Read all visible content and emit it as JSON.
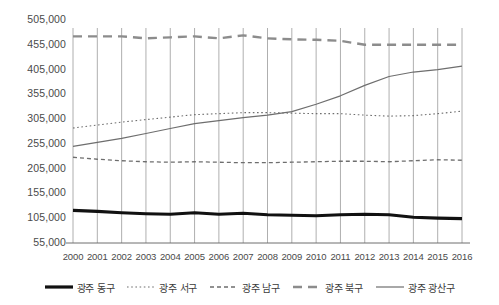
{
  "chart_data": {
    "type": "line",
    "title": "",
    "xlabel": "",
    "ylabel": "",
    "x": [
      2000,
      2001,
      2002,
      2003,
      2004,
      2005,
      2006,
      2007,
      2008,
      2009,
      2010,
      2011,
      2012,
      2013,
      2014,
      2015,
      2016
    ],
    "categories": [
      "2000",
      "2001",
      "2002",
      "2003",
      "2004",
      "2005",
      "2006",
      "2007",
      "2008",
      "2009",
      "2010",
      "2011",
      "2012",
      "2013",
      "2014",
      "2015",
      "2016"
    ],
    "ylim": [
      55000,
      505000
    ],
    "ytick_labels": [
      "505,000",
      "455,000",
      "405,000",
      "355,000",
      "305,000",
      "255,000",
      "205,000",
      "155,000",
      "105,000",
      "55,000"
    ],
    "yticks": [
      505000,
      455000,
      405000,
      355000,
      305000,
      255000,
      205000,
      155000,
      105000,
      55000
    ],
    "ystep": 50000,
    "grid": "vertical-only",
    "legend_position": "bottom",
    "series": [
      {
        "name": "광주 동구",
        "style": "thick-solid",
        "color": "#111111",
        "width": 3.2,
        "dash": "",
        "values": [
          121000,
          119000,
          116000,
          114000,
          113000,
          116000,
          113000,
          115000,
          112000,
          111000,
          110000,
          112000,
          113000,
          112000,
          107000,
          105000,
          104000
        ]
      },
      {
        "name": "광주 서구",
        "style": "dotted",
        "color": "#6e6e6e",
        "width": 1.1,
        "dash": "1.6 2.6",
        "values": [
          287000,
          293000,
          299000,
          304000,
          309000,
          314000,
          316000,
          318000,
          318000,
          317000,
          316000,
          316000,
          313000,
          311000,
          312000,
          316000,
          321000
        ]
      },
      {
        "name": "광주 남구",
        "style": "dash-dot-small",
        "color": "#6e6e6e",
        "width": 1.3,
        "dash": "4 3",
        "values": [
          228000,
          224000,
          221000,
          219000,
          218000,
          219000,
          218000,
          217000,
          217000,
          218000,
          219000,
          220000,
          220000,
          219000,
          221000,
          223000,
          222000
        ]
      },
      {
        "name": "광주 북구",
        "style": "long-dash",
        "color": "#8c8c8c",
        "width": 2.4,
        "dash": "9 6",
        "values": [
          472000,
          472000,
          472000,
          468000,
          470000,
          472000,
          468000,
          474000,
          468000,
          466000,
          465000,
          463000,
          455000,
          455000,
          455000,
          455000,
          455000
        ]
      },
      {
        "name": "광주 광산구",
        "style": "thin-solid",
        "color": "#6e6e6e",
        "width": 1.2,
        "dash": "",
        "values": [
          250000,
          258000,
          266000,
          276000,
          286000,
          296000,
          302000,
          308000,
          313000,
          320000,
          335000,
          352000,
          373000,
          391000,
          400000,
          405000,
          412000
        ]
      }
    ]
  },
  "axis": {
    "left_label_count": 10,
    "x_label_count": 17
  }
}
